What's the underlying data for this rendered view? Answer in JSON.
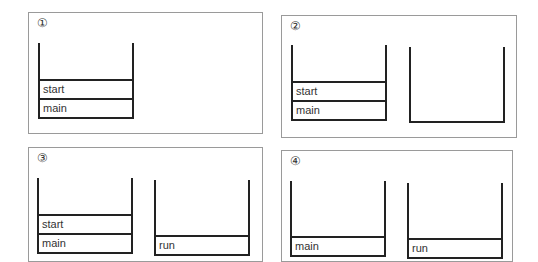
{
  "panels": [
    {
      "label": "①",
      "stacks": [
        {
          "frames": [
            "start",
            "main"
          ]
        }
      ]
    },
    {
      "label": "②",
      "stacks": [
        {
          "frames": [
            "start",
            "main"
          ]
        },
        {
          "frames": []
        }
      ]
    },
    {
      "label": "③",
      "stacks": [
        {
          "frames": [
            "start",
            "main"
          ]
        },
        {
          "frames": [
            "run"
          ]
        }
      ]
    },
    {
      "label": "④",
      "stacks": [
        {
          "frames": [
            "main"
          ]
        },
        {
          "frames": [
            "run"
          ]
        }
      ]
    }
  ],
  "colors": {
    "border": "#9a9a9a",
    "stroke": "#222222",
    "text": "#333333"
  }
}
